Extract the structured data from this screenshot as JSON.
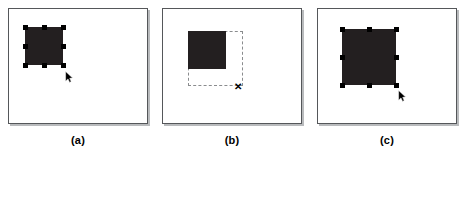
{
  "figure": {
    "type": "ui-interaction-sequence",
    "background_color": "#ffffff",
    "panel_border_color": "#55575a",
    "panel_shadow_color": "#b9bbbd",
    "shape_color": "#231f20",
    "handle_color": "#000000",
    "preview_stroke_color": "#8a8c8e"
  },
  "panels": [
    {
      "id": "a",
      "caption": "(a)",
      "state": "selected",
      "frame": {
        "x": 8,
        "y": 8,
        "width": 140,
        "height": 116
      },
      "shape": {
        "x": 25,
        "y": 27,
        "width": 38,
        "height": 38
      },
      "handles": [
        {
          "name": "handle-top-left",
          "x": 25,
          "y": 27
        },
        {
          "name": "handle-top-center",
          "x": 44,
          "y": 27
        },
        {
          "name": "handle-top-right",
          "x": 63,
          "y": 27
        },
        {
          "name": "handle-middle-left",
          "x": 25,
          "y": 46
        },
        {
          "name": "handle-middle-right",
          "x": 63,
          "y": 46
        },
        {
          "name": "handle-bottom-left",
          "x": 25,
          "y": 65
        },
        {
          "name": "handle-bottom-center",
          "x": 44,
          "y": 65
        },
        {
          "name": "handle-bottom-right",
          "x": 63,
          "y": 65
        }
      ],
      "cursor": {
        "type": "arrow",
        "x": 65,
        "y": 69
      },
      "preview": null,
      "caption_box": {
        "x": 48,
        "y": 134,
        "width": 60
      }
    },
    {
      "id": "b",
      "caption": "(b)",
      "state": "dragging-resize",
      "frame": {
        "x": 162,
        "y": 8,
        "width": 140,
        "height": 116
      },
      "shape": {
        "x": 188,
        "y": 31,
        "width": 38,
        "height": 38
      },
      "handles": [],
      "cursor": {
        "type": "cross",
        "x": 233,
        "y": 82,
        "glyph": "✕"
      },
      "preview": {
        "x": 188,
        "y": 31,
        "width": 55,
        "height": 55
      },
      "caption_box": {
        "x": 202,
        "y": 134,
        "width": 60
      }
    },
    {
      "id": "c",
      "caption": "(c)",
      "state": "resized-selected",
      "frame": {
        "x": 317,
        "y": 8,
        "width": 140,
        "height": 116
      },
      "shape": {
        "x": 342,
        "y": 29,
        "width": 54,
        "height": 56
      },
      "handles": [
        {
          "name": "handle-top-left",
          "x": 342,
          "y": 29
        },
        {
          "name": "handle-top-center",
          "x": 369,
          "y": 29
        },
        {
          "name": "handle-top-right",
          "x": 396,
          "y": 29
        },
        {
          "name": "handle-middle-left",
          "x": 342,
          "y": 57
        },
        {
          "name": "handle-middle-right",
          "x": 396,
          "y": 57
        },
        {
          "name": "handle-bottom-left",
          "x": 342,
          "y": 85
        },
        {
          "name": "handle-bottom-center",
          "x": 369,
          "y": 85
        },
        {
          "name": "handle-bottom-right",
          "x": 396,
          "y": 85
        }
      ],
      "cursor": {
        "type": "arrow",
        "x": 398,
        "y": 88
      },
      "preview": null,
      "caption_box": {
        "x": 357,
        "y": 134,
        "width": 60
      }
    }
  ]
}
